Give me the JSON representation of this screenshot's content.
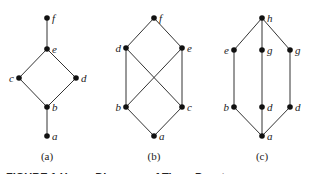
{
  "diagrams": [
    {
      "id": "a",
      "caption": "(a)",
      "caption_pos": [
        47,
        160
      ],
      "nodes": [
        {
          "label": "f",
          "x": 47,
          "y": 18,
          "side": "right"
        },
        {
          "label": "e",
          "x": 47,
          "y": 49,
          "side": "right"
        },
        {
          "label": "c",
          "x": 19,
          "y": 78,
          "side": "left"
        },
        {
          "label": "d",
          "x": 76,
          "y": 78,
          "side": "right"
        },
        {
          "label": "b",
          "x": 47,
          "y": 107,
          "side": "right"
        },
        {
          "label": "a",
          "x": 47,
          "y": 136,
          "side": "right"
        }
      ],
      "edges": [
        [
          0,
          1
        ],
        [
          1,
          2
        ],
        [
          1,
          3
        ],
        [
          2,
          4
        ],
        [
          3,
          4
        ],
        [
          4,
          5
        ]
      ]
    },
    {
      "id": "b",
      "caption": "(b)",
      "caption_pos": [
        154,
        160
      ],
      "nodes": [
        {
          "label": "f",
          "x": 154,
          "y": 18,
          "side": "right"
        },
        {
          "label": "d",
          "x": 126,
          "y": 48,
          "side": "left"
        },
        {
          "label": "e",
          "x": 182,
          "y": 48,
          "side": "right"
        },
        {
          "label": "b",
          "x": 126,
          "y": 107,
          "side": "left"
        },
        {
          "label": "c",
          "x": 182,
          "y": 107,
          "side": "right"
        },
        {
          "label": "a",
          "x": 154,
          "y": 136,
          "side": "right"
        }
      ],
      "edges": [
        [
          0,
          1
        ],
        [
          0,
          2
        ],
        [
          1,
          3
        ],
        [
          1,
          4
        ],
        [
          2,
          3
        ],
        [
          2,
          4
        ],
        [
          3,
          5
        ],
        [
          4,
          5
        ]
      ]
    },
    {
      "id": "c",
      "caption": "(c)",
      "caption_pos": [
        262,
        160
      ],
      "nodes": [
        {
          "label": "h",
          "x": 262,
          "y": 18,
          "side": "right"
        },
        {
          "label": "e",
          "x": 234,
          "y": 50,
          "side": "left"
        },
        {
          "label": "g",
          "x": 262,
          "y": 50,
          "side": "right"
        },
        {
          "label": "g",
          "x": 290,
          "y": 50,
          "side": "right"
        },
        {
          "label": "b",
          "x": 234,
          "y": 107,
          "side": "left"
        },
        {
          "label": "d",
          "x": 262,
          "y": 107,
          "side": "right"
        },
        {
          "label": "d",
          "x": 290,
          "y": 107,
          "side": "right"
        },
        {
          "label": "a",
          "x": 262,
          "y": 136,
          "side": "right"
        }
      ],
      "edges": [
        [
          0,
          1
        ],
        [
          0,
          2
        ],
        [
          0,
          3
        ],
        [
          1,
          4
        ],
        [
          2,
          5
        ],
        [
          3,
          6
        ],
        [
          4,
          7
        ],
        [
          5,
          7
        ],
        [
          6,
          7
        ]
      ]
    }
  ],
  "figure_caption": "FIGURE 1  Hasse Diagrams  of Three  Posets"
}
